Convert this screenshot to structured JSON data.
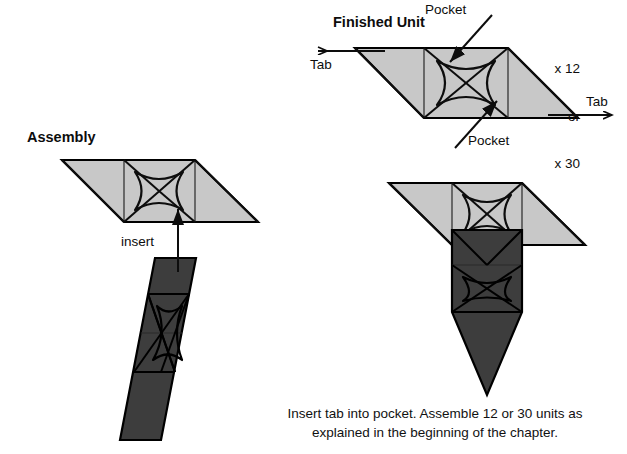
{
  "figure": {
    "title_finished_unit": "Finished Unit",
    "title_assembly": "Assembly",
    "caption_line_1": "Insert tab into pocket.  Assemble 12 or 30 units as",
    "caption_line_2": "explained in the beginning of the chapter."
  },
  "annotations": {
    "pocket_top": "Pocket",
    "pocket_bottom": "Pocket",
    "tab_left": "Tab",
    "tab_right": "Tab",
    "insert": "insert",
    "count_line_1": "x 12",
    "count_line_2": "or",
    "count_line_3": "x 30"
  },
  "colors": {
    "paper_light": "#c8c8c8",
    "paper_light_shade": "#bdbdbd",
    "paper_dark": "#3d3d3d",
    "paper_dark_shade": "#363636",
    "crease": "#1a1a1a",
    "outline": "#000000",
    "background": "#ffffff",
    "text": "#111111"
  },
  "units": {
    "finished_unit": {
      "fill": "#c8c8c8",
      "description": "single folded parallelogram module shown flat with two pockets and two tabs"
    },
    "assembly_top_unit": {
      "fill": "#c8c8c8",
      "description": "light module receiving the tab"
    },
    "assembly_bottom_unit": {
      "fill": "#3d3d3d",
      "description": "dark module rotated 90 degrees whose tab is inserted upward"
    },
    "joined_light_unit": {
      "fill": "#c8c8c8",
      "description": "light module of completed joint"
    },
    "joined_dark_unit": {
      "fill": "#3d3d3d",
      "description": "dark module locked into the light module pocket"
    }
  }
}
